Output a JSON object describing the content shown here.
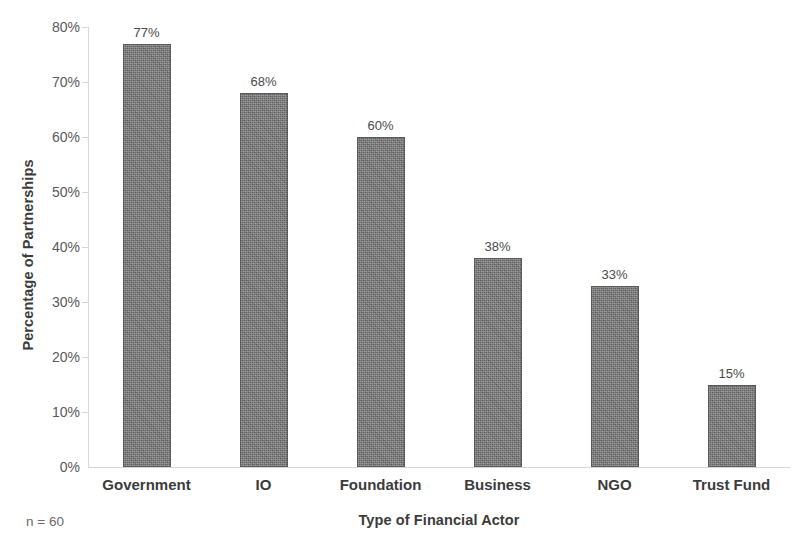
{
  "chart_data": {
    "type": "bar",
    "title": "",
    "categories": [
      "Government",
      "IO",
      "Foundation",
      "Business",
      "NGO",
      "Trust Fund"
    ],
    "values": [
      77,
      68,
      60,
      38,
      33,
      15
    ],
    "value_labels": [
      "77%",
      "68%",
      "60%",
      "38%",
      "33%",
      "15%"
    ],
    "xlabel": "Type of Financial Actor",
    "ylabel": "Percentage of Partnerships",
    "ylim": [
      0,
      80
    ],
    "ytick_values": [
      0,
      10,
      20,
      30,
      40,
      50,
      60,
      70,
      80
    ],
    "ytick_labels": [
      "0%",
      "10%",
      "20%",
      "30%",
      "40%",
      "50%",
      "60%",
      "70%",
      "80%"
    ],
    "grid": false,
    "legend": "none",
    "annotation": "n = 60",
    "bar_color": "#787878",
    "bar_border_color": "#5b5b5b",
    "axis_color": "#d6d6d6",
    "text_color": "#3b3b3b",
    "tick_text_color": "#5a5a5a",
    "background_color": "#ffffff"
  }
}
